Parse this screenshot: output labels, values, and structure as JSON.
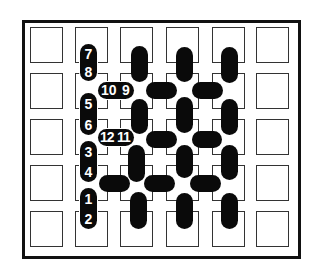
{
  "diagram": {
    "grid": {
      "columns": 6,
      "rows": 5
    },
    "colors": {
      "pill": "#0a0a0a",
      "cell_border": "#333333",
      "frame": "#111111",
      "background": "#ffffff",
      "label": "#ffffff"
    },
    "numbered_pills": [
      {
        "orientation": "vertical",
        "labels": [
          "7",
          "8"
        ]
      },
      {
        "orientation": "horizontal",
        "labels": [
          "10",
          "9"
        ]
      },
      {
        "orientation": "vertical",
        "labels": [
          "5",
          "6"
        ]
      },
      {
        "orientation": "horizontal",
        "labels": [
          "12",
          "11"
        ]
      },
      {
        "orientation": "vertical",
        "labels": [
          "3",
          "4"
        ]
      },
      {
        "orientation": "vertical",
        "labels": [
          "1",
          "2"
        ]
      }
    ]
  }
}
